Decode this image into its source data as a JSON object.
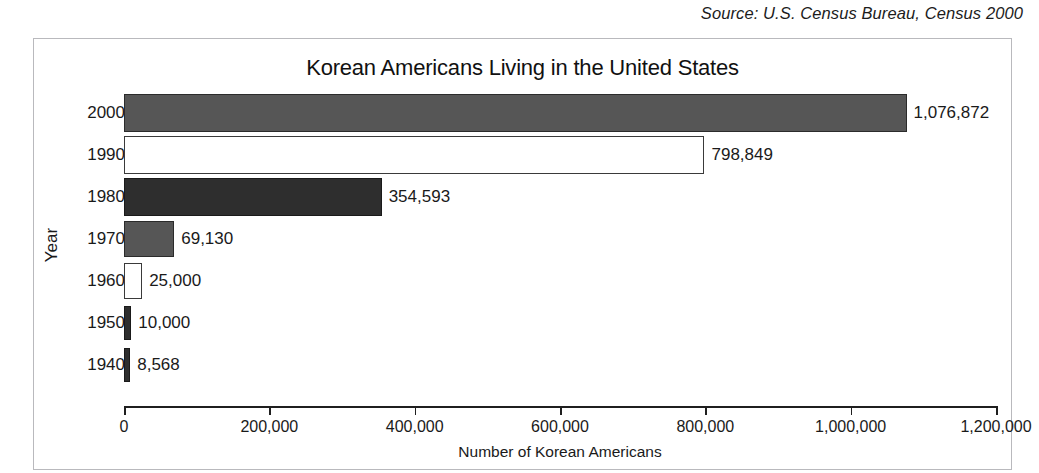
{
  "source": {
    "text": "Source: U.S. Census Bureau, Census 2000"
  },
  "chart_data": {
    "type": "bar",
    "orientation": "horizontal",
    "title": "Korean Americans Living in the United States",
    "xlabel": "Number of Korean Americans",
    "ylabel": "Year",
    "categories": [
      "2000",
      "1990",
      "1980",
      "1970",
      "1960",
      "1950",
      "1940"
    ],
    "values": [
      1076872,
      798849,
      354593,
      69130,
      25000,
      10000,
      8568
    ],
    "value_labels": [
      "1,076,872",
      "798,849",
      "354,593",
      "69,130",
      "25,000",
      "10,000",
      "8,568"
    ],
    "bar_styles": [
      "gray",
      "white",
      "dark",
      "gray",
      "white",
      "dark",
      "dark"
    ],
    "colors": {
      "gray": "#565656",
      "dark": "#2e2e2e",
      "white": "#ffffff",
      "outline": "#1f1f1f"
    },
    "xlim": [
      0,
      1200000
    ],
    "xticks": [
      0,
      200000,
      400000,
      600000,
      800000,
      1000000,
      1200000
    ],
    "xtick_labels": [
      "0",
      "200,000",
      "400,000",
      "600,000",
      "800,000",
      "1,000,000",
      "1,200,000"
    ],
    "grid": false,
    "legend": null
  }
}
